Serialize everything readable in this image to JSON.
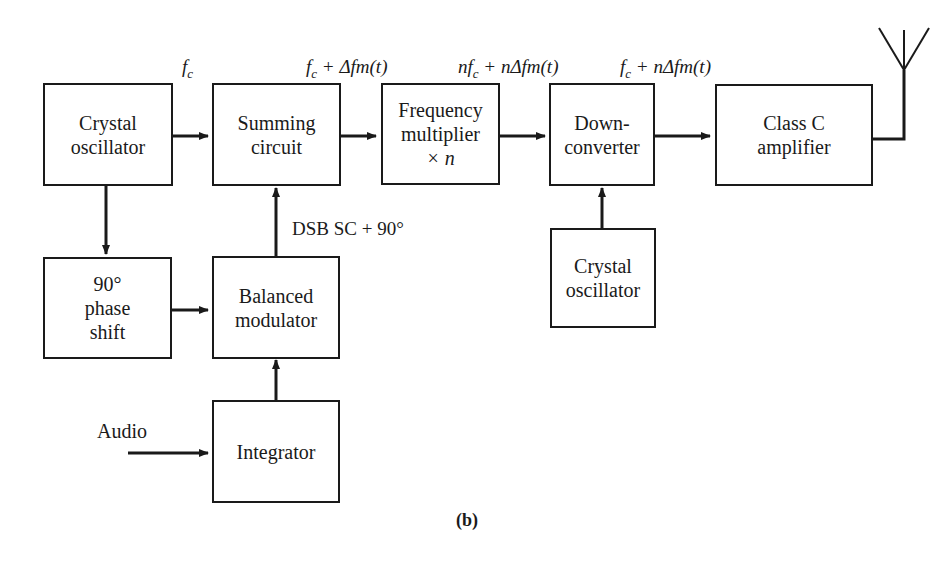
{
  "diagram": {
    "caption": "(b)",
    "blocks": {
      "crystal_osc_1": [
        "Crystal",
        "oscillator"
      ],
      "summing": [
        "Summing",
        "circuit"
      ],
      "freq_mult": [
        "Frequency",
        "multiplier",
        "× n"
      ],
      "downconv": [
        "Down-",
        "converter"
      ],
      "class_c": [
        "Class C",
        "amplifier"
      ],
      "phase_shift": [
        "90°",
        "phase",
        "shift"
      ],
      "balanced_mod": [
        "Balanced",
        "modulator"
      ],
      "integrator": [
        "Integrator"
      ],
      "crystal_osc_2": [
        "Crystal",
        "oscillator"
      ]
    },
    "signal_labels": {
      "fc": "f",
      "fc_sub": "c",
      "sum_out": " + Δfm(t)",
      "mult_out_prefix": "nf",
      "mult_out": " + nΔfm(t)",
      "down_out": " + nΔfm(t)",
      "dsb": "DSB SC + 90°",
      "audio": "Audio"
    }
  }
}
